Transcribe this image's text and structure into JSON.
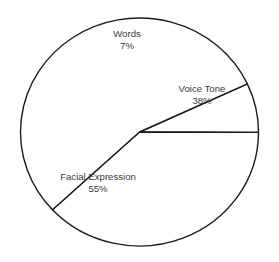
{
  "chart_data": {
    "type": "pie",
    "title": "",
    "subtitle": "",
    "xlabel": "",
    "ylabel": "",
    "grid": false,
    "legend_position": "none",
    "label_style": "inside-slice",
    "unit": "%",
    "total": 100,
    "categories": [
      "Words",
      "Voice Tone",
      "Facial Expression"
    ],
    "values": [
      7,
      38,
      55
    ],
    "slices": [
      {
        "name": "Words",
        "label": "Words",
        "value": 7,
        "value_label": "7%",
        "fill": "#ffffff",
        "stroke": "#1a1a1a",
        "start_angle_deg": 335.0,
        "end_angle_deg": 360.2,
        "label_x": 127,
        "label_y": 34,
        "value_x": 127,
        "value_y": 46
      },
      {
        "name": "Voice Tone",
        "label": "Voice Tone",
        "value": 38,
        "value_label": "38%",
        "fill": "#ffffff",
        "stroke": "#1a1a1a",
        "start_angle_deg": 360.2,
        "end_angle_deg": 497.0,
        "label_x": 202,
        "label_y": 89,
        "value_x": 202,
        "value_y": 101
      },
      {
        "name": "Facial Expression",
        "label": "Facial Expression",
        "value": 55,
        "value_label": "55%",
        "fill": "#ffffff",
        "stroke": "#1a1a1a",
        "start_angle_deg": 497.0,
        "end_angle_deg": 695.0,
        "label_x": 98,
        "label_y": 177,
        "value_x": 98,
        "value_y": 189
      }
    ],
    "geometry": {
      "center_x": 139.5,
      "center_y": 132,
      "radius": 114,
      "radius_x": 119,
      "radius_y": 114
    },
    "colors": {
      "background": "#ffffff",
      "slice_fill": "#ffffff",
      "outline": "#1a1a1a",
      "text": "#3a3a3a"
    }
  }
}
